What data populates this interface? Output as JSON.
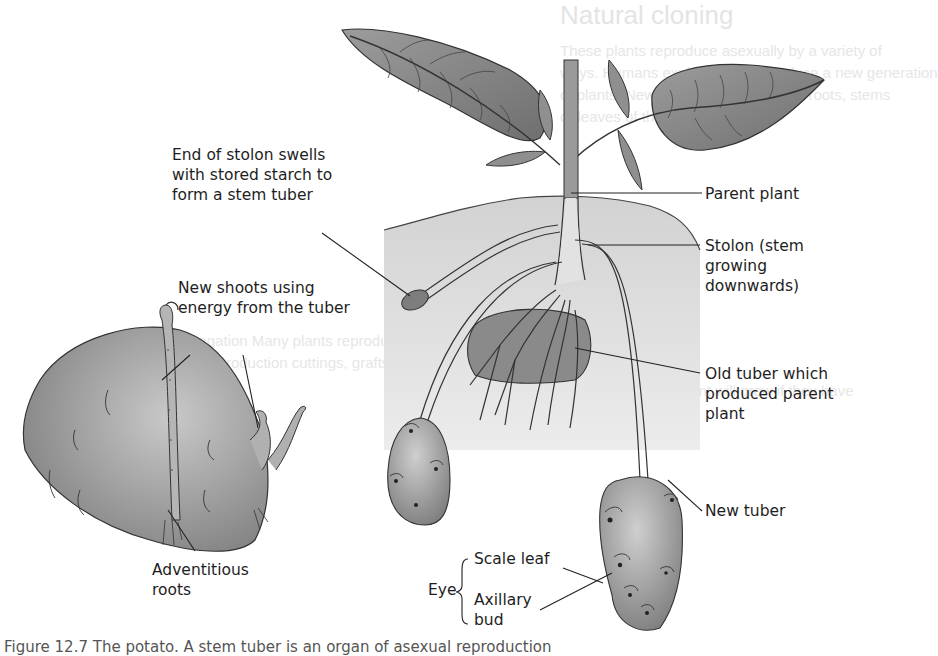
{
  "background_ghost": {
    "title": "Natural cloning",
    "lines": [
      "These plants reproduce asexually by a variety of",
      "ways. Humans exploit them to produce a new generation",
      "of plants. New plants are grown from roots, stems",
      "or leaves of the parent plant.",
      "Plant propagation  Many plants reproduce in this way.",
      "Vegetative reproduction  cuttings, grafts, tubers",
      "The sections of a plant will grow if they have"
    ]
  },
  "diagram": {
    "labels": {
      "stolon_end": "End of stolon swells\nwith stored starch to\nform a stem tuber",
      "parent_plant": "Parent plant",
      "stolon": "Stolon (stem\ngrowing\ndownwards)",
      "new_shoots": "New shoots using\nenergy from the tuber",
      "old_tuber": "Old tuber which\nproduced parent\nplant",
      "new_tuber": "New tuber",
      "adventitious_roots": "Adventitious\nroots",
      "eye": "Eye",
      "scale_leaf": "Scale leaf",
      "axillary_bud": "Axillary\nbud"
    },
    "colors": {
      "soil": "#d9d9d9",
      "leaf": "#8a8a8a",
      "tuber": "#9a9a9a",
      "outline": "#333333"
    }
  },
  "caption": "Figure 12.7 The potato. A stem tuber is an organ of asexual reproduction"
}
